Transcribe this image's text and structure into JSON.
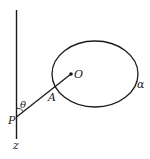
{
  "diagram": {
    "labels": {
      "P": "P",
      "z": "z",
      "theta": "θ",
      "A": "A",
      "O": "O",
      "alpha": "α"
    },
    "colors": {
      "stroke": "#1a1a1a",
      "background": "#ffffff"
    }
  }
}
